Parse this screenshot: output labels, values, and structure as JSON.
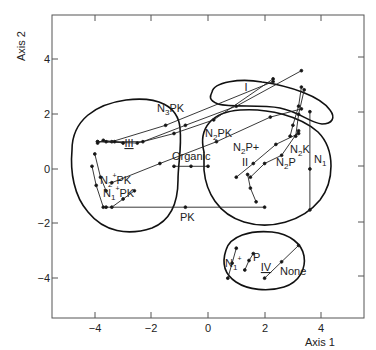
{
  "chart_data": {
    "type": "scatter",
    "title": "",
    "xlabel": "Axis 1",
    "ylabel": "Axis 2",
    "xlim": [
      -5.3,
      5.5
    ],
    "ylim": [
      -5.5,
      5.6
    ],
    "xticks": [
      -4,
      -2,
      0,
      2,
      4
    ],
    "yticks": [
      -4,
      -2,
      0,
      2,
      4
    ],
    "xtick_labels": [
      "−4",
      "−2",
      "0",
      "2",
      "4"
    ],
    "ytick_labels": [
      "−4",
      "−2",
      "0",
      "2",
      "4"
    ],
    "grid": false,
    "groups": [
      {
        "name": "I",
        "label_pos": [
          1.3,
          3.0
        ]
      },
      {
        "name": "II",
        "label_pos": [
          1.3,
          0.25
        ]
      },
      {
        "name": "III",
        "label_pos": [
          -2.8,
          0.95
        ]
      },
      {
        "name": "IV",
        "label_pos": [
          2.05,
          -3.9
        ]
      }
    ],
    "treatment_labels": [
      {
        "text": "N3PK",
        "pos": [
          -2.3,
          1.9
        ]
      },
      {
        "text": "N2PK",
        "pos": [
          -0.8,
          1.15
        ]
      },
      {
        "text": "N2P+",
        "pos": [
          1.0,
          0.6
        ]
      },
      {
        "text": "N2P",
        "pos": [
          2.1,
          -0.1
        ]
      },
      {
        "text": "N2K",
        "pos": [
          3.0,
          0.3
        ]
      },
      {
        "text": "N1",
        "pos": [
          3.6,
          0.0
        ]
      },
      {
        "text": "Organic",
        "pos": [
          -0.9,
          0.2
        ]
      },
      {
        "text": "N2PK",
        "pos": [
          -3.7,
          -0.55
        ]
      },
      {
        "text": "N1PK",
        "pos": [
          -3.7,
          -1.05
        ]
      },
      {
        "text": "PK",
        "pos": [
          -0.8,
          -1.85
        ]
      },
      {
        "text": "N1",
        "pos": [
          0.75,
          -3.55
        ]
      },
      {
        "text": "P",
        "pos": [
          1.65,
          -3.35
        ]
      },
      {
        "text": "None",
        "pos": [
          2.9,
          -4.2
        ]
      }
    ],
    "trajectories": [
      {
        "name": "N3PK-a",
        "points": [
          [
            -3.9,
            1.0
          ],
          [
            -3.4,
            1.0
          ],
          [
            -1.5,
            1.6
          ],
          [
            2.3,
            3.2
          ]
        ]
      },
      {
        "name": "N3PK-b",
        "points": [
          [
            -3.9,
            1.0
          ],
          [
            -2.5,
            0.95
          ],
          [
            -1.2,
            1.3
          ],
          [
            0.2,
            1.8
          ],
          [
            2.3,
            3.3
          ]
        ]
      },
      {
        "name": "N3PK-c",
        "points": [
          [
            -3.6,
            1.0
          ],
          [
            -2.3,
            1.0
          ],
          [
            -0.8,
            1.6
          ],
          [
            1.0,
            2.3
          ],
          [
            3.3,
            3.6
          ]
        ]
      },
      {
        "name": "III-cluster",
        "points": [
          [
            -3.9,
            0.95
          ],
          [
            -3.7,
            1.05
          ],
          [
            -3.3,
            1.0
          ],
          [
            -3.0,
            0.95
          ]
        ]
      },
      {
        "name": "N2PK-long",
        "points": [
          [
            -3.4,
            -0.5
          ],
          [
            -1.7,
            0.2
          ],
          [
            0.3,
            1.0
          ],
          [
            2.2,
            1.9
          ],
          [
            3.3,
            2.2
          ]
        ]
      },
      {
        "name": "N2P+",
        "points": [
          [
            1.0,
            -0.3
          ],
          [
            1.6,
            0.2
          ],
          [
            2.4,
            0.9
          ],
          [
            3.2,
            1.3
          ]
        ]
      },
      {
        "name": "N2K",
        "points": [
          [
            3.3,
            3.0
          ],
          [
            3.2,
            2.3
          ],
          [
            3.0,
            1.6
          ],
          [
            2.9,
            1.2
          ]
        ]
      },
      {
        "name": "N2K-b",
        "points": [
          [
            3.4,
            2.9
          ],
          [
            3.2,
            2.0
          ],
          [
            3.1,
            1.2
          ]
        ]
      },
      {
        "name": "N2P",
        "points": [
          [
            3.2,
            1.4
          ],
          [
            2.6,
            0.5
          ],
          [
            2.0,
            0.2
          ],
          [
            1.5,
            -0.3
          ]
        ]
      },
      {
        "name": "N1-right",
        "points": [
          [
            3.6,
            2.1
          ],
          [
            3.6,
            0.0
          ],
          [
            3.6,
            -1.5
          ]
        ]
      },
      {
        "name": "II-inner",
        "points": [
          [
            1.4,
            -0.2
          ],
          [
            1.5,
            -0.7
          ],
          [
            1.7,
            -1.2
          ]
        ]
      },
      {
        "name": "Organic",
        "points": [
          [
            -1.2,
            0.1
          ],
          [
            -0.6,
            0.1
          ],
          [
            0.0,
            0.1
          ]
        ]
      },
      {
        "name": "N2PK-left",
        "points": [
          [
            -4.0,
            0.55
          ],
          [
            -3.8,
            -0.3
          ],
          [
            -3.6,
            -0.8
          ]
        ]
      },
      {
        "name": "N2PK-left-b",
        "points": [
          [
            -4.1,
            0.1
          ],
          [
            -3.95,
            -0.6
          ],
          [
            -3.7,
            -1.4
          ]
        ]
      },
      {
        "name": "N1PK",
        "points": [
          [
            -2.6,
            -0.8
          ],
          [
            -3.0,
            -1.1
          ],
          [
            -3.4,
            -1.4
          ]
        ]
      },
      {
        "name": "PK",
        "points": [
          [
            2.0,
            -1.4
          ],
          [
            -0.8,
            -1.4
          ],
          [
            -3.6,
            -1.4
          ]
        ]
      },
      {
        "name": "IV-N1",
        "points": [
          [
            1.0,
            -2.9
          ],
          [
            0.85,
            -3.45
          ],
          [
            0.7,
            -4.0
          ]
        ]
      },
      {
        "name": "IV-P",
        "points": [
          [
            1.6,
            -3.1
          ],
          [
            1.45,
            -3.35
          ],
          [
            1.3,
            -3.7
          ]
        ]
      },
      {
        "name": "None",
        "points": [
          [
            3.2,
            -2.8
          ],
          [
            2.6,
            -3.4
          ],
          [
            2.0,
            -4.0
          ]
        ]
      }
    ]
  }
}
